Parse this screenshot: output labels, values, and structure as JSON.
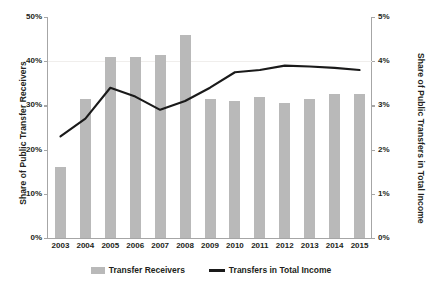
{
  "chart_data": {
    "type": "bar",
    "title": "",
    "subtitle": "",
    "xlabel": "",
    "ylabel": "Share of Public Transfer Receivers",
    "y2label": "Share of Public Transfers in Total Income",
    "categories": [
      "2003",
      "2004",
      "2005",
      "2006",
      "2007",
      "2008",
      "2009",
      "2010",
      "2011",
      "2012",
      "2013",
      "2014",
      "2015"
    ],
    "ylim": [
      0,
      50
    ],
    "y2lim": [
      0,
      5
    ],
    "yticks": [
      0,
      10,
      20,
      30,
      40,
      50
    ],
    "ytick_labels": [
      "0%",
      "10%",
      "20%",
      "30%",
      "40%",
      "50%"
    ],
    "y2ticks": [
      0,
      1,
      2,
      3,
      4,
      5
    ],
    "y2tick_labels": [
      "0%",
      "1%",
      "2%",
      "3%",
      "4%",
      "5%"
    ],
    "grid": "horizontal-faint-at-40",
    "legend_position": "bottom-center",
    "series": [
      {
        "name": "Transfer Receivers",
        "type": "bar",
        "axis": "left",
        "color": "#b9b9b9",
        "values": [
          16.0,
          31.5,
          41.0,
          41.0,
          41.5,
          46.0,
          31.5,
          31.0,
          32.0,
          30.5,
          31.5,
          32.5,
          32.5
        ]
      },
      {
        "name": "Transfers in Total Income",
        "type": "line",
        "axis": "right",
        "color": "#1a1a1a",
        "values": [
          2.3,
          2.7,
          3.4,
          3.2,
          2.9,
          3.1,
          3.4,
          3.75,
          3.8,
          3.9,
          3.88,
          3.85,
          3.8
        ]
      }
    ]
  },
  "legend": {
    "items": [
      {
        "label": "Transfer Receivers",
        "marker": "bar-swatch"
      },
      {
        "label": "Transfers in Total Income",
        "marker": "line-swatch"
      }
    ]
  }
}
